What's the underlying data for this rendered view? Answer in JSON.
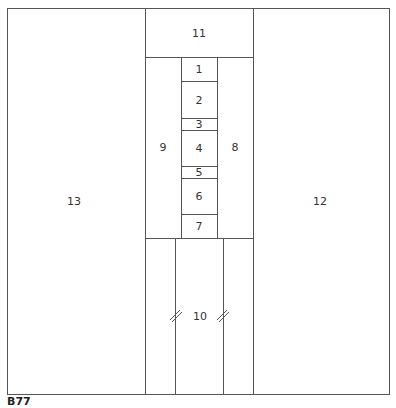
{
  "diagram": {
    "caption": "B77",
    "regions": [
      {
        "id": "1",
        "label": "1"
      },
      {
        "id": "2",
        "label": "2"
      },
      {
        "id": "3",
        "label": "3"
      },
      {
        "id": "4",
        "label": "4"
      },
      {
        "id": "5",
        "label": "5"
      },
      {
        "id": "6",
        "label": "6"
      },
      {
        "id": "7",
        "label": "7"
      },
      {
        "id": "8",
        "label": "8"
      },
      {
        "id": "9",
        "label": "9"
      },
      {
        "id": "10",
        "label": "10"
      },
      {
        "id": "11",
        "label": "11"
      },
      {
        "id": "12",
        "label": "12"
      },
      {
        "id": "13",
        "label": "13"
      }
    ],
    "line_color": "#555555"
  }
}
